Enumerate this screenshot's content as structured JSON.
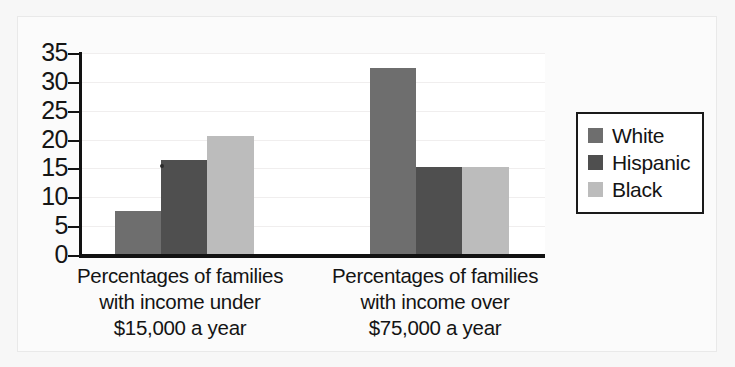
{
  "chart_data": {
    "type": "bar",
    "title": "",
    "xlabel": "",
    "ylabel": "",
    "ylim": [
      0,
      35
    ],
    "yticks": [
      0,
      5,
      10,
      15,
      20,
      25,
      30,
      35
    ],
    "grid": true,
    "legend_position": "right",
    "categories": [
      "Percentages of families with income under $15,000 a year",
      "Percentages of families with income over $75,000 a year"
    ],
    "category_lines": [
      [
        "Percentages of families",
        "with income under",
        "$15,000 a year"
      ],
      [
        "Percentages of families",
        "with income over",
        "$75,000 a year"
      ]
    ],
    "series": [
      {
        "name": "White",
        "color": "#6e6e6e",
        "values": [
          7.7,
          32.4
        ]
      },
      {
        "name": "Hispanic",
        "color": "#4f4f4f",
        "values": [
          16.5,
          15.2
        ]
      },
      {
        "name": "Black",
        "color": "#bcbcbc",
        "values": [
          20.6,
          15.3
        ]
      }
    ]
  },
  "axis": {
    "tick_labels": [
      "35",
      "30",
      "25",
      "20",
      "15",
      "10",
      "5",
      "0"
    ]
  },
  "legend": {
    "items": [
      {
        "label": "White",
        "color": "#6e6e6e"
      },
      {
        "label": "Hispanic",
        "color": "#4f4f4f"
      },
      {
        "label": "Black",
        "color": "#bcbcbc"
      }
    ]
  },
  "colors": {
    "white_series": "#6e6e6e",
    "hispanic_series": "#4f4f4f",
    "black_series": "#bcbcbc",
    "axis": "#121212",
    "gridline": "#f0eeee",
    "background": "#f7f7f7",
    "plot_background": "#ffffff"
  }
}
